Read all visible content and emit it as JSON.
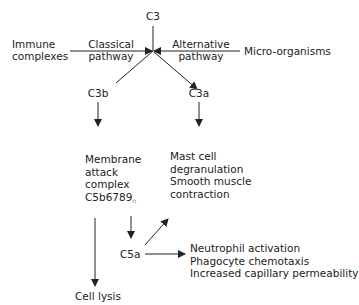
{
  "diagram": {
    "nodes": {
      "c3": "C3",
      "immune_complexes": [
        "Immune",
        "complexes"
      ],
      "classical_pathway": [
        "Classical",
        "pathway"
      ],
      "alternative_pathway": [
        "Alternative",
        "pathway"
      ],
      "micro_organisms": "Micro-organisms",
      "c3b": "C3b",
      "c3a": "C3a",
      "membrane_attack_complex": [
        "Membrane",
        "attack",
        "complex",
        "C5b6789"
      ],
      "mac_subscript": "n",
      "c3a_effects": [
        "Mast cell",
        "degranulation",
        "Smooth muscle",
        "contraction"
      ],
      "c5a": "C5a",
      "c5a_effects": [
        "Neutrophil activation",
        "Phagocyte chemotaxis",
        "Increased capillary permeability"
      ],
      "cell_lysis": "Cell lysis"
    },
    "edges": [
      {
        "from": "Immune complexes",
        "to": "C3",
        "label": "Classical pathway"
      },
      {
        "from": "Micro-organisms",
        "to": "C3",
        "label": "Alternative pathway"
      },
      {
        "from": "C3",
        "to": "C3b"
      },
      {
        "from": "C3",
        "to": "C3a"
      },
      {
        "from": "C3b",
        "to": "Membrane attack complex C5b6789n"
      },
      {
        "from": "C3a",
        "to": "Mast cell degranulation / Smooth muscle contraction"
      },
      {
        "from": "Membrane attack complex C5b6789n",
        "to": "C5a"
      },
      {
        "from": "C5a",
        "to": "Mast cell degranulation / Smooth muscle contraction"
      },
      {
        "from": "C5a",
        "to": "Neutrophil activation / Phagocyte chemotaxis / Increased capillary permeability"
      },
      {
        "from": "Membrane attack complex C5b6789n",
        "to": "Cell lysis"
      }
    ],
    "colors": {
      "line": "#222222",
      "text": "#222222",
      "background": "#ffffff"
    }
  }
}
